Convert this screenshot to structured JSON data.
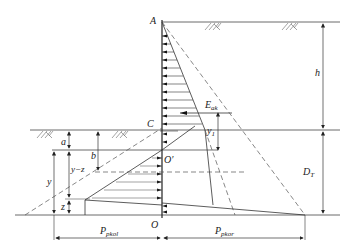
{
  "diagram": {
    "points": {
      "A": "A",
      "C": "C",
      "O_prime": "O′",
      "O": "O"
    },
    "dimensions": {
      "h": "h",
      "D_T_main": "D",
      "D_T_sub": "T",
      "a": "a",
      "b": "b",
      "y": "y",
      "y_minus_z": "y−z",
      "z": "z",
      "y1_main": "y",
      "y1_sub": "1"
    },
    "forces": {
      "E_ak_main": "E",
      "E_ak_sub": "ak",
      "P_pkol_main": "P",
      "P_pkol_sub": "pkol",
      "P_pkor_main": "P",
      "P_pkor_sub": "pkor"
    },
    "colors": {
      "line": "#333333",
      "dashed": "#555555",
      "arrow": "#111111"
    }
  }
}
